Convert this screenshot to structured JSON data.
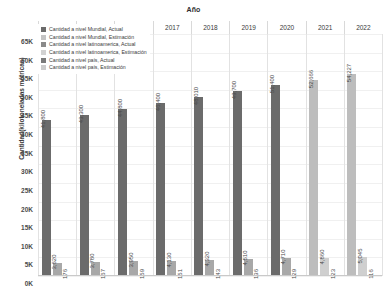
{
  "chart_data": {
    "type": "bar",
    "title": "",
    "xlabel": "Año",
    "ylabel": "Cantidad(kilotoneladas métricas)",
    "ylim": [
      0,
      65000
    ],
    "ytick_labels": [
      "65K",
      "60K",
      "55K",
      "50K",
      "45K",
      "40K",
      "35K",
      "30K",
      "25K",
      "20K",
      "15K",
      "10K",
      "5K",
      "0K"
    ],
    "ytick_values": [
      65000,
      60000,
      55000,
      50000,
      45000,
      40000,
      35000,
      30000,
      25000,
      20000,
      15000,
      10000,
      5000,
      0
    ],
    "grid": true,
    "legend_position": "top-left",
    "categories": [
      "2014",
      "2015",
      "2016",
      "2017",
      "2018",
      "2019",
      "2020",
      "2021",
      "2022"
    ],
    "series": [
      {
        "name": "Cantidad a nivel Mundial, Actual",
        "color": "#6b6b6b",
        "values": [
          41800,
          43300,
          44800,
          46400,
          48010,
          49700,
          51400,
          null,
          null
        ],
        "labels": [
          "41,800",
          "43,300",
          "44,800",
          "46,400",
          "48,010",
          "49,700",
          "51,400",
          "",
          ""
        ]
      },
      {
        "name": "Cantidad a nivel Mundial, Estimación",
        "color": "#bdbdbd",
        "values": [
          null,
          null,
          null,
          null,
          null,
          null,
          null,
          52666,
          54227
        ],
        "labels": [
          "",
          "",
          "",
          "",
          "",
          "",
          "",
          "52,666",
          "54,227"
        ]
      },
      {
        "name": "Cantidad a nivel latinoamerica, Actual",
        "color": "#a8a8a8",
        "values": [
          3620,
          3780,
          3950,
          4130,
          4320,
          4510,
          4710,
          null,
          null
        ],
        "labels": [
          "3,620",
          "3,780",
          "3,950",
          "4,130",
          "4,320",
          "4,510",
          "4,710",
          "",
          ""
        ]
      },
      {
        "name": "Cantidad a nivel latinoamerica, Estimación",
        "color": "#cfcfcf",
        "values": [
          null,
          null,
          null,
          null,
          null,
          null,
          null,
          4860,
          5045
        ],
        "labels": [
          "",
          "",
          "",
          "",
          "",
          "",
          "",
          "4,860",
          "5,045"
        ]
      },
      {
        "name": "Cantidad a nivel país, Actual",
        "color": "#8f8f8f",
        "values": [
          176,
          167,
          159,
          151,
          143,
          136,
          129,
          null,
          null
        ],
        "labels": [
          "176",
          "167",
          "159",
          "151",
          "143",
          "136",
          "129",
          "",
          ""
        ]
      },
      {
        "name": "Cantidad a nivel país, Estimación",
        "color": "#d4d4d4",
        "values": [
          null,
          null,
          null,
          null,
          null,
          null,
          null,
          123,
          116
        ],
        "labels": [
          "",
          "",
          "",
          "",
          "",
          "",
          "",
          "123",
          "116"
        ]
      }
    ]
  },
  "legend": {
    "items": [
      {
        "label": "Cantidad a nivel Mundial, Actual",
        "swatch": "#6b6b6b"
      },
      {
        "label": "Cantidad a nivel Mundial, Estimación",
        "swatch": "#c4c4c4"
      },
      {
        "label": "Cantidad a nivel latinoamerica, Actual",
        "swatch": "#8a8a8a"
      },
      {
        "label": "Cantidad a nivel latinoamerica, Estimación",
        "swatch": "#d2d2d2"
      },
      {
        "label": "Cantidad a nivel país, Actual",
        "swatch": "#7a7a7a"
      },
      {
        "label": "Cantidad a nivel país, Estimación",
        "swatch": "#cccccc"
      }
    ]
  }
}
